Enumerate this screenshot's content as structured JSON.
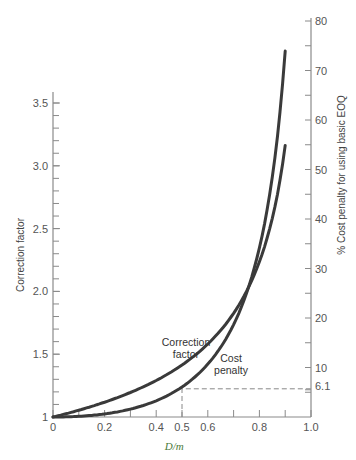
{
  "chart_data": {
    "type": "line",
    "title": "",
    "xlabel": "D/m",
    "ylabel": "Correction factor",
    "y2label": "% Cost penalty for using basic EOQ",
    "xlim": [
      0,
      1.0
    ],
    "ylim": [
      1,
      3.6
    ],
    "y2lim": [
      0,
      80
    ],
    "x_ticks": [
      0,
      0.2,
      0.4,
      0.5,
      0.6,
      0.8,
      1.0
    ],
    "x_tick_labels": [
      "0",
      "0.2",
      "0.4",
      "0.5",
      "0.6",
      "0.8",
      "1.0"
    ],
    "x_minor_ticks": [
      0.1,
      0.3,
      0.7,
      0.9
    ],
    "y_ticks": [
      1,
      1.5,
      2.0,
      2.5,
      3.0,
      3.5
    ],
    "y_tick_labels": [
      "1",
      "1.5",
      "2.0",
      "2.5",
      "3.0",
      "3.5"
    ],
    "y2_ticks": [
      10,
      20,
      30,
      40,
      50,
      60,
      70,
      80
    ],
    "y2_tick_labels": [
      "10",
      "20",
      "30",
      "40",
      "50",
      "60",
      "70",
      "80"
    ],
    "y2_special_tick": {
      "value": 6.1,
      "label": "6.1"
    },
    "grid": false,
    "legend": "none",
    "series": [
      {
        "name": "Correction factor",
        "axis": "left",
        "x": [
          0,
          0.1,
          0.2,
          0.3,
          0.4,
          0.5,
          0.6,
          0.7,
          0.75,
          0.8,
          0.85,
          0.9
        ],
        "values": [
          1.0,
          1.054,
          1.118,
          1.195,
          1.291,
          1.414,
          1.581,
          1.826,
          2.0,
          2.236,
          2.582,
          3.162
        ]
      },
      {
        "name": "Cost penalty",
        "axis": "right",
        "x": [
          0,
          0.1,
          0.2,
          0.3,
          0.4,
          0.5,
          0.6,
          0.7,
          0.75,
          0.8,
          0.85,
          0.9,
          0.905
        ],
        "values": [
          0,
          0.1,
          0.6,
          1.5,
          3.3,
          6.1,
          10.7,
          18.4,
          25.0,
          34.2,
          48.4,
          73.9,
          76.0
        ]
      }
    ],
    "annotations": [
      {
        "text": "Correction factor",
        "lines": [
          "Correction",
          "factor"
        ]
      },
      {
        "text": "Cost penalty",
        "lines": [
          "Cost",
          "penalty"
        ]
      },
      {
        "text": "dashed reference at D/m = 0.5, cost penalty 6.1%"
      }
    ]
  }
}
